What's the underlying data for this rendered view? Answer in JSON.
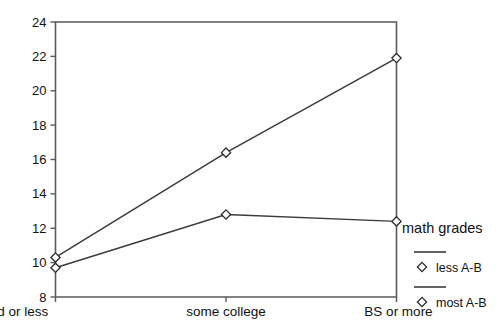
{
  "chart_data": {
    "type": "line",
    "title": "",
    "xlabel": "",
    "ylabel": "",
    "categories": [
      "hs grad or less",
      "some college",
      "BS or more"
    ],
    "series": [
      {
        "name": "less A-B",
        "values": [
          10.3,
          16.4,
          21.9
        ]
      },
      {
        "name": "most A-B",
        "values": [
          9.7,
          12.8,
          12.4
        ]
      }
    ],
    "ylim": [
      8,
      24
    ],
    "yticks": [
      8,
      10,
      12,
      14,
      16,
      18,
      20,
      22,
      24
    ],
    "ytick_labels": [
      "8",
      "10",
      "12",
      "14",
      "16",
      "18",
      "20",
      "22",
      "24"
    ],
    "grid": false,
    "legend_position": "right",
    "legend_title": "math grades",
    "marker": "diamond",
    "colors": {
      "line": "#3b3b3b",
      "axis": "#5a5a5a",
      "marker_fill": "#ffffff",
      "marker_stroke": "#2b2b2b",
      "text": "#111111",
      "background": "#ffffff"
    }
  }
}
